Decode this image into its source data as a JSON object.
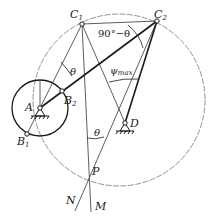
{
  "diagram": {
    "points": {
      "A": {
        "label": "A",
        "x": 40,
        "y": 108
      },
      "B1": {
        "label": "B",
        "sub": "1",
        "x": 27,
        "y": 134
      },
      "B2": {
        "label": "B",
        "sub": "2",
        "x": 62,
        "y": 91
      },
      "C1": {
        "label": "C",
        "sub": "1",
        "x": 82,
        "y": 24
      },
      "C2": {
        "label": "C",
        "sub": "2",
        "x": 157,
        "y": 21
      },
      "D": {
        "label": "D",
        "x": 125,
        "y": 123
      },
      "P": {
        "label": "P",
        "x": 88,
        "y": 179
      },
      "N": {
        "label": "N"
      },
      "M": {
        "label": "M"
      }
    },
    "angles": {
      "theta_top": "θ",
      "complement": "90°−θ",
      "psi": "ψ",
      "psi_sub": "max",
      "theta_bottom": "θ"
    },
    "colors": {
      "stroke": "#1a1a1a",
      "thin": "#333333",
      "circle": "#555555"
    }
  }
}
